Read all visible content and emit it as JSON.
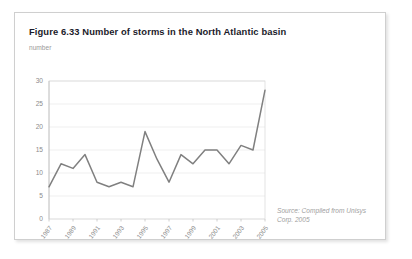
{
  "figure": {
    "title": "Figure 6.33 Number of storms in the North Atlantic basin",
    "source_note": "Source: Compiled from Unisys Corp. 2005",
    "frame_color": "#cfcfcf",
    "background": "#ffffff"
  },
  "chart_data": {
    "type": "line",
    "title": "Figure 6.33 Number of storms in the North Atlantic basin",
    "xlabel": "",
    "ylabel": "number",
    "ylim": [
      0,
      30
    ],
    "y_ticks": [
      0,
      5,
      10,
      15,
      20,
      25,
      30
    ],
    "y_tick_labels": [
      "0",
      "5",
      "10",
      "15",
      "20",
      "25",
      "30"
    ],
    "xlim": [
      1987,
      2005
    ],
    "x_ticks": [
      1987,
      1989,
      1991,
      1993,
      1995,
      1997,
      1999,
      2001,
      2003,
      2005
    ],
    "x_tick_labels": [
      "1987",
      "1989",
      "1991",
      "1993",
      "1995",
      "1997",
      "1999",
      "2001",
      "2003",
      "2005"
    ],
    "x": [
      1987,
      1988,
      1989,
      1990,
      1991,
      1992,
      1993,
      1994,
      1995,
      1996,
      1997,
      1998,
      1999,
      2000,
      2001,
      2002,
      2003,
      2004,
      2005
    ],
    "values": [
      7,
      12,
      11,
      14,
      8,
      7,
      8,
      7,
      19,
      13,
      8,
      14,
      12,
      15,
      15,
      12,
      16,
      15,
      28
    ],
    "series": [
      {
        "name": "Number of storms",
        "values": [
          7,
          12,
          11,
          14,
          8,
          7,
          8,
          7,
          19,
          13,
          8,
          14,
          12,
          15,
          15,
          12,
          16,
          15,
          28
        ]
      }
    ],
    "line_color": "#808080",
    "grid": true,
    "grid_color": "#e8e8e8",
    "legend": false,
    "legend_position": "none"
  }
}
